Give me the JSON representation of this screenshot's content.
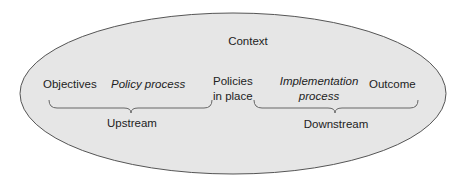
{
  "diagram": {
    "type": "context-ellipse-process",
    "colors": {
      "ellipse_fill": "#e6e6e6",
      "ellipse_stroke": "#555555",
      "brace_stroke": "#666666",
      "text": "#222222"
    },
    "context_label": "Context",
    "nodes": [
      {
        "id": "objectives",
        "label": "Objectives",
        "style": "normal"
      },
      {
        "id": "policy_process",
        "label": "Policy process",
        "style": "italic"
      },
      {
        "id": "policies_in_place",
        "label_line1": "Policies",
        "label_line2": "in place",
        "style": "normal"
      },
      {
        "id": "implementation_process",
        "label_line1": "Implementation",
        "label_line2": "process",
        "style": "italic"
      },
      {
        "id": "outcome",
        "label": "Outcome",
        "style": "normal"
      }
    ],
    "groups": [
      {
        "id": "upstream",
        "label": "Upstream",
        "spans": [
          "objectives",
          "policy_process"
        ]
      },
      {
        "id": "downstream",
        "label": "Downstream",
        "spans": [
          "implementation_process",
          "outcome"
        ]
      }
    ]
  }
}
